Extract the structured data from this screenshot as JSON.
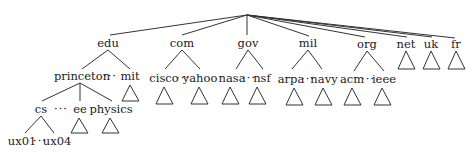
{
  "diagram": {
    "type": "tree",
    "root": "",
    "ellipsis": "···",
    "nodes": {
      "edu": "edu",
      "com": "com",
      "gov": "gov",
      "mil": "mil",
      "org": "org",
      "net": "net",
      "uk": "uk",
      "fr": "fr",
      "princeton": "princeton",
      "mit": "mit",
      "cisco": "cisco",
      "yahoo": "yahoo",
      "nasa": "nasa",
      "nsf": "nsf",
      "arpa": "arpa",
      "navy": "navy",
      "acm": "acm",
      "ieee": "ieee",
      "cs": "cs",
      "ee": "ee",
      "physics": "physics",
      "ux01": "ux01",
      "ux04": "ux04"
    },
    "edges": [
      [
        "root",
        "edu"
      ],
      [
        "root",
        "com"
      ],
      [
        "root",
        "gov"
      ],
      [
        "root",
        "mil"
      ],
      [
        "root",
        "org"
      ],
      [
        "root",
        "net"
      ],
      [
        "root",
        "uk"
      ],
      [
        "root",
        "fr"
      ],
      [
        "edu",
        "princeton"
      ],
      [
        "edu",
        "mit"
      ],
      [
        "com",
        "cisco"
      ],
      [
        "com",
        "yahoo"
      ],
      [
        "gov",
        "nasa"
      ],
      [
        "gov",
        "nsf"
      ],
      [
        "mil",
        "arpa"
      ],
      [
        "mil",
        "navy"
      ],
      [
        "org",
        "acm"
      ],
      [
        "org",
        "ieee"
      ],
      [
        "princeton",
        "cs"
      ],
      [
        "princeton",
        "ee"
      ],
      [
        "princeton",
        "physics"
      ],
      [
        "cs",
        "ux01"
      ],
      [
        "cs",
        "ux04"
      ]
    ],
    "subtree_triangles": [
      "net",
      "uk",
      "fr",
      "mit",
      "cisco",
      "yahoo",
      "nasa",
      "nsf",
      "arpa",
      "navy",
      "acm",
      "ieee",
      "ee",
      "physics"
    ]
  }
}
